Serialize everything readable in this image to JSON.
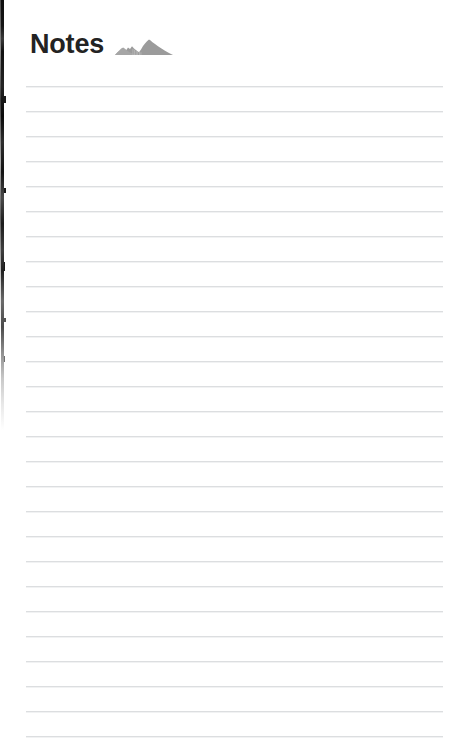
{
  "page": {
    "title": "Notes",
    "background_color": "#ffffff",
    "width": 459,
    "height": 750
  },
  "header": {
    "title": "Notes",
    "logo_icon": "mountain-range-icon",
    "logo_color": "#9b9b9b",
    "title_color": "#232323"
  },
  "notepad": {
    "line_color": "#dcdee0",
    "line_count": 27,
    "line_spacing_px": 25,
    "first_line_y": 86,
    "line_left_x": 26,
    "line_width": 417,
    "lines": [
      {
        "index": 1,
        "text": ""
      },
      {
        "index": 2,
        "text": ""
      },
      {
        "index": 3,
        "text": ""
      },
      {
        "index": 4,
        "text": ""
      },
      {
        "index": 5,
        "text": ""
      },
      {
        "index": 6,
        "text": ""
      },
      {
        "index": 7,
        "text": ""
      },
      {
        "index": 8,
        "text": ""
      },
      {
        "index": 9,
        "text": ""
      },
      {
        "index": 10,
        "text": ""
      },
      {
        "index": 11,
        "text": ""
      },
      {
        "index": 12,
        "text": ""
      },
      {
        "index": 13,
        "text": ""
      },
      {
        "index": 14,
        "text": ""
      },
      {
        "index": 15,
        "text": ""
      },
      {
        "index": 16,
        "text": ""
      },
      {
        "index": 17,
        "text": ""
      },
      {
        "index": 18,
        "text": ""
      },
      {
        "index": 19,
        "text": ""
      },
      {
        "index": 20,
        "text": ""
      },
      {
        "index": 21,
        "text": ""
      },
      {
        "index": 22,
        "text": ""
      },
      {
        "index": 23,
        "text": ""
      },
      {
        "index": 24,
        "text": ""
      },
      {
        "index": 25,
        "text": ""
      },
      {
        "index": 26,
        "text": ""
      },
      {
        "index": 27,
        "text": ""
      }
    ]
  },
  "scan_artifact": {
    "name": "page-edge-shadow",
    "color": "#101010",
    "side": "left",
    "top": 0,
    "height": 430
  }
}
